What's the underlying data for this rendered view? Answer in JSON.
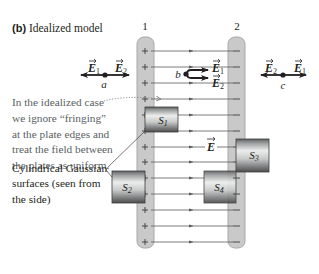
{
  "figure": {
    "panel_label": "(b)",
    "title": "Idealized model",
    "plates": [
      {
        "id": "1",
        "label": "1",
        "charge_sign": "+"
      },
      {
        "id": "2",
        "label": "2",
        "charge_sign": "–"
      }
    ],
    "field_label": "E",
    "field_line_count": 13,
    "points": {
      "a": {
        "label": "a",
        "left_vector": "E",
        "left_sub": "1",
        "right_vector": "E",
        "right_sub": "2"
      },
      "b": {
        "label": "b",
        "upper_vector": "E",
        "upper_sub": "1",
        "lower_vector": "E",
        "lower_sub": "2"
      },
      "c": {
        "label": "c",
        "left_vector": "E",
        "left_sub": "2",
        "right_vector": "E",
        "right_sub": "1"
      }
    },
    "gaussian_surfaces": [
      {
        "id": "S1",
        "label": "S",
        "sub": "1"
      },
      {
        "id": "S2",
        "label": "S",
        "sub": "2"
      },
      {
        "id": "S3",
        "label": "S",
        "sub": "3"
      },
      {
        "id": "S4",
        "label": "S",
        "sub": "4"
      }
    ],
    "annotations": {
      "fringing_note": [
        "In the idealized case",
        "we ignore “fringing”",
        "at the plate edges and",
        "treat the field between",
        "the plates as uniform."
      ],
      "cylinder_caption": [
        "Cylindrical Gaussian",
        "surfaces (seen from",
        "the side)"
      ]
    },
    "colors": {
      "plate_fill": "#c9c9c9",
      "plate_stroke": "#a8a8a8",
      "field_line": "#5b5b5b",
      "vector": "#231f20",
      "note_text": "#5a5f63",
      "dotted_pointer": "#7a7f85",
      "cylinder_light": "#eceeee",
      "cylinder_dark": "#4d4d4d"
    }
  }
}
